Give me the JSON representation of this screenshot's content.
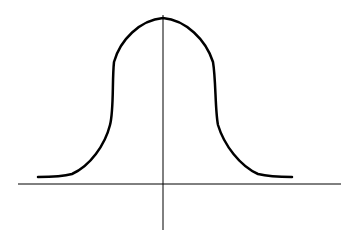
{
  "diagram": {
    "type": "bell-curve",
    "colors": {
      "background": "#ffffff",
      "axis": "#000000",
      "curve": "#000000"
    },
    "axes": {
      "x_axis": {
        "x1": 18,
        "y1": 184,
        "x2": 341,
        "y2": 184
      },
      "y_axis": {
        "x1": 163,
        "y1": 15,
        "x2": 163,
        "y2": 230
      }
    },
    "curve_path": "M38,177 C55,177 65,176 72,174 C90,166 105,145 110,125 C114,110 112,80 114,62 C120,40 140,20 163,18 C186,20 206,40 213,62 C216,80 215,110 218,125 C224,145 240,166 258,174 C266,176 276,177 292,177"
  }
}
